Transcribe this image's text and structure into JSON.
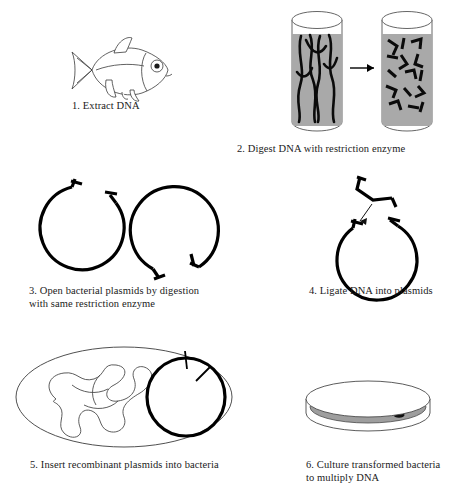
{
  "figure": {
    "background": "#ffffff",
    "ink_color": "#000000",
    "medium_color": "#a9a9a9"
  },
  "steps": [
    {
      "number": "1",
      "caption": "1. Extract DNA",
      "illustration": "fish",
      "elements": [
        "fish-body",
        "tail-fin",
        "dorsal-fin",
        "pectoral-fin",
        "pelvic-fin",
        "eye"
      ]
    },
    {
      "number": "2",
      "caption": "2. Digest DNA with restriction enzyme",
      "illustration": "two-test-tubes-with-arrow",
      "elements": [
        "test-tube-intact-dna",
        "reaction-arrow",
        "test-tube-digested-dna"
      ],
      "left_tube_contents": "long intact DNA strands",
      "right_tube_contents": "short DNA fragments",
      "strand_count_left": 6,
      "fragment_count_right": 14
    },
    {
      "number": "3",
      "caption": "3. Open bacterial plasmids by digestion\n    with same restriction enzyme",
      "illustration": "two-open-plasmids",
      "elements": [
        "plasmid-open-left",
        "plasmid-open-right",
        "sticky-end-overhang"
      ],
      "plasmid_count": 2,
      "gap_position_left": "top",
      "gap_position_right": "bottom"
    },
    {
      "number": "4",
      "caption": "4. Ligate DNA into plasmids",
      "illustration": "fragment-inserted-into-plasmid",
      "elements": [
        "dna-fragment-sticky-ends",
        "insertion-arrow",
        "plasmid-open"
      ],
      "plasmid_count": 1
    },
    {
      "number": "5",
      "caption": "5. Insert recombinant plasmids into bacteria",
      "illustration": "bacterium-with-plasmid",
      "elements": [
        "bacterium-outline",
        "bacterial-chromosome",
        "recombinant-plasmid",
        "ligation-tick"
      ],
      "tick_count": 2
    },
    {
      "number": "6",
      "caption": "6. Culture transformed bacteria\n    to multiply DNA",
      "illustration": "petri-dish-with-colonies",
      "elements": [
        "petri-dish",
        "agar-medium",
        "bacterial-colony"
      ],
      "colony_count": 9
    }
  ]
}
